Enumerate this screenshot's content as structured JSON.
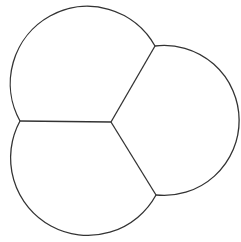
{
  "diagram": {
    "type": "three-lobed-cell-partition",
    "stroke_color": "#333333",
    "background": "#ffffff",
    "center": {
      "x": 111,
      "y": 122
    },
    "junctions": [
      {
        "name": "upper-right",
        "x": 155,
        "y": 46
      },
      {
        "name": "left",
        "x": 20,
        "y": 121
      },
      {
        "name": "lower-right",
        "x": 156,
        "y": 195
      }
    ],
    "lobes": [
      {
        "name": "top-left-lobe",
        "from": "left",
        "to": "upper-right",
        "radius": 75
      },
      {
        "name": "right-lobe",
        "from": "upper-right",
        "to": "lower-right",
        "radius": 75
      },
      {
        "name": "bottom-left-lobe",
        "from": "lower-right",
        "to": "left",
        "radius": 77
      }
    ]
  },
  "caption": {
    "text": ""
  }
}
